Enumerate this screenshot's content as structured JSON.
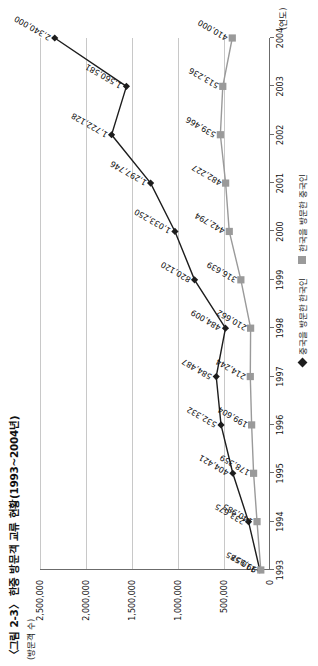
{
  "figure": {
    "title": "〈그림 2-3〉 한중 방문객 교류 현황(1993~2004년)",
    "y_unit": "(방문객 수)",
    "x_unit": "(연도)"
  },
  "legend": {
    "items": [
      {
        "label": "중국을 방문한 한국인",
        "marker": "diamond-marker",
        "color": "#1d1d1d"
      },
      {
        "label": "한국을 방문한 중국인",
        "marker": "square-marker",
        "color": "#9a9a9a"
      }
    ]
  },
  "chart_data": {
    "type": "line",
    "title": "〈그림 2-3〉 한중 방문객 교류 현황(1993~2004년)",
    "xlabel": "(연도)",
    "ylabel": "(방문객 수)",
    "categories": [
      "1993",
      "1994",
      "1995",
      "1996",
      "1997",
      "1998",
      "1999",
      "2000",
      "2001",
      "2002",
      "2003",
      "2004"
    ],
    "ylim": [
      0,
      2500000
    ],
    "yticks": [
      0,
      500000,
      1000000,
      1500000,
      2000000,
      2500000
    ],
    "ytick_labels": [
      "0",
      "500,000",
      "1,000,000",
      "1,500,000",
      "2,000,000",
      "2,500,000"
    ],
    "grid": true,
    "legend_position": "bottom-right",
    "series": [
      {
        "name": "중국을 방문한 한국인",
        "color": "#1d1d1d",
        "marker": "diamond",
        "values": [
          110585,
          233675,
          404421,
          532332,
          584487,
          484009,
          820120,
          1033250,
          1297746,
          1722128,
          1560581,
          2340000
        ],
        "labels": [
          "110,585",
          "233,675",
          "404,421",
          "532,332",
          "584,487",
          "484,009",
          "820,120",
          "1,033,250",
          "1,297,746",
          "1,722,128",
          "1,560,581",
          "2,340,000"
        ]
      },
      {
        "name": "한국을 방문한 중국인",
        "color": "#9a9a9a",
        "marker": "square",
        "values": [
          99957,
          140985,
          178359,
          199604,
          214244,
          210662,
          316639,
          442794,
          482227,
          539466,
          513236,
          410000
        ],
        "labels": [
          "99,957",
          "140,985",
          "178,359",
          "199,604",
          "214,244",
          "210,662",
          "316,639",
          "442,794",
          "482,227",
          "539,466",
          "513,236",
          "410,000"
        ]
      }
    ]
  }
}
